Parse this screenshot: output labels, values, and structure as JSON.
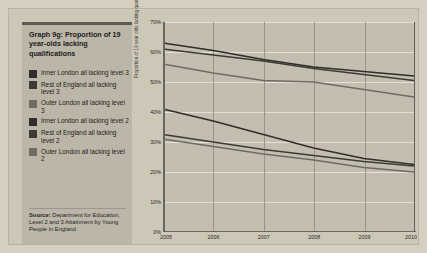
{
  "chart_data": {
    "type": "line",
    "title": "Graph 9g: Proportion of 19 year-olds lacking qualifications",
    "xlabel": "",
    "ylabel": "Proportion of 19 year olds lacking qualifications in each year",
    "x": [
      2005,
      2006,
      2007,
      2008,
      2009,
      2010
    ],
    "xtick_labels": [
      "2005",
      "2006",
      "2007",
      "2008",
      "2009",
      "2010"
    ],
    "ylim": [
      0,
      70
    ],
    "ytick_labels": [
      "0%",
      "10%",
      "20%",
      "30%",
      "40%",
      "50%",
      "60%",
      "70%"
    ],
    "ytick_values": [
      0,
      10,
      20,
      30,
      40,
      50,
      60,
      70
    ],
    "grid": true,
    "legend_position": "left-panel",
    "series": [
      {
        "name": "Inner London all lacking level 3",
        "color": "#2e2d29",
        "values": [
          63.0,
          60.5,
          57.5,
          55.0,
          53.5,
          52.0
        ]
      },
      {
        "name": "Rest of England all lacking level 3",
        "color": "#3b3a35",
        "values": [
          61.0,
          59.0,
          57.0,
          54.5,
          52.5,
          50.5
        ]
      },
      {
        "name": "Outer London all lacking level 3",
        "color": "#6e6b63",
        "values": [
          56.0,
          53.0,
          50.5,
          50.0,
          47.5,
          45.0
        ]
      },
      {
        "name": "Inner London all lacking level 2",
        "color": "#2e2d29",
        "values": [
          41.0,
          37.0,
          32.5,
          28.0,
          24.5,
          22.5
        ]
      },
      {
        "name": "Rest of England all lacking level 2",
        "color": "#3b3a35",
        "values": [
          32.5,
          30.0,
          27.5,
          25.5,
          23.5,
          22.0
        ]
      },
      {
        "name": "Outer London all lacking level 2",
        "color": "#6e6b63",
        "values": [
          31.0,
          28.5,
          26.0,
          24.0,
          21.5,
          20.0
        ]
      }
    ]
  },
  "legend": {
    "items": [
      {
        "label": "Inner London all lacking level 3",
        "color": "#2e2d29"
      },
      {
        "label": "Rest of England all lacking level 3",
        "color": "#3b3a35"
      },
      {
        "label": "Outer London all lacking level 3",
        "color": "#6e6b63"
      },
      {
        "label": "Inner London all lacking level 2",
        "color": "#2e2d29"
      },
      {
        "label": "Rest of England all lacking level 2",
        "color": "#3b3a35"
      },
      {
        "label": "Outer London all lacking level 2",
        "color": "#6e6b63"
      }
    ]
  },
  "source": {
    "prefix": "Source:",
    "text": " Department for Education, Level 2 and 3 Attainment by Young People in England"
  }
}
